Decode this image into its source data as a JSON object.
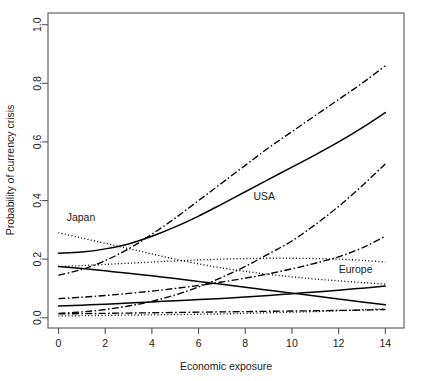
{
  "chart_data": {
    "type": "line",
    "title": "",
    "xlabel": "Economic exposure",
    "ylabel": "Probability of currency crisis",
    "xlim": [
      -0.45,
      14.8
    ],
    "ylim": [
      -0.035,
      1.04
    ],
    "xticks": [
      0,
      2,
      4,
      6,
      8,
      10,
      12,
      14
    ],
    "xticklabels": [
      "0",
      "2",
      "4",
      "6",
      "8",
      "10",
      "12",
      "14"
    ],
    "yticks": [
      0.0,
      0.2,
      0.4,
      0.6,
      0.8,
      1.0
    ],
    "yticklabels": [
      "0.0",
      "0.2",
      "0.4",
      "0.6",
      "0.8",
      "1.0"
    ],
    "grid": false,
    "legend": "none",
    "box": true,
    "annotations": [
      {
        "text": "Japan",
        "x": 0.35,
        "y": 0.345
      },
      {
        "text": "USA",
        "x": 8.35,
        "y": 0.415
      },
      {
        "text": "Europe",
        "x": 12.0,
        "y": 0.165
      }
    ],
    "x": [
      0,
      1,
      2,
      3,
      4,
      5,
      6,
      7,
      8,
      9,
      10,
      11,
      12,
      13,
      14
    ],
    "series": [
      {
        "name": "rising-dashdot-high",
        "style": "dashdot",
        "values": [
          0.145,
          0.165,
          0.195,
          0.235,
          0.285,
          0.34,
          0.4,
          0.46,
          0.52,
          0.58,
          0.635,
          0.69,
          0.745,
          0.8,
          0.86
        ]
      },
      {
        "name": "usa-solid-rising",
        "style": "solid",
        "values": [
          0.22,
          0.224,
          0.235,
          0.252,
          0.278,
          0.31,
          0.347,
          0.388,
          0.43,
          0.472,
          0.514,
          0.556,
          0.6,
          0.648,
          0.7
        ]
      },
      {
        "name": "rising-dashdot-mid",
        "style": "dashdot",
        "values": [
          0.015,
          0.02,
          0.028,
          0.04,
          0.056,
          0.078,
          0.105,
          0.138,
          0.175,
          0.218,
          0.262,
          0.318,
          0.38,
          0.45,
          0.525
        ]
      },
      {
        "name": "japan-dotted-falling",
        "style": "dotted",
        "values": [
          0.29,
          0.272,
          0.254,
          0.236,
          0.218,
          0.2,
          0.184,
          0.17,
          0.158,
          0.148,
          0.14,
          0.132,
          0.126,
          0.12,
          0.115
        ]
      },
      {
        "name": "rising-dotted-low",
        "style": "dotted",
        "values": [
          0.175,
          0.178,
          0.182,
          0.186,
          0.19,
          0.194,
          0.197,
          0.2,
          0.202,
          0.203,
          0.203,
          0.202,
          0.2,
          0.196,
          0.19
        ]
      },
      {
        "name": "rising-dashdot-low",
        "style": "dashdot",
        "values": [
          0.065,
          0.07,
          0.076,
          0.083,
          0.091,
          0.1,
          0.11,
          0.122,
          0.135,
          0.15,
          0.167,
          0.186,
          0.208,
          0.238,
          0.278
        ]
      },
      {
        "name": "europe-solid-slow-rise",
        "style": "solid",
        "values": [
          0.04,
          0.043,
          0.046,
          0.05,
          0.054,
          0.058,
          0.062,
          0.066,
          0.071,
          0.076,
          0.082,
          0.088,
          0.094,
          0.101,
          0.108
        ]
      },
      {
        "name": "solid-falling-flat",
        "style": "solid",
        "values": [
          0.175,
          0.168,
          0.16,
          0.152,
          0.143,
          0.134,
          0.124,
          0.114,
          0.104,
          0.094,
          0.084,
          0.074,
          0.064,
          0.054,
          0.044
        ]
      },
      {
        "name": "flat-dashdot-baseline",
        "style": "dashdot",
        "values": [
          0.013,
          0.014,
          0.015,
          0.016,
          0.017,
          0.018,
          0.019,
          0.02,
          0.021,
          0.022,
          0.023,
          0.024,
          0.025,
          0.026,
          0.028
        ]
      },
      {
        "name": "flat-dotted-baseline",
        "style": "dotted",
        "values": [
          0.006,
          0.007,
          0.008,
          0.009,
          0.01,
          0.011,
          0.012,
          0.013,
          0.015,
          0.017,
          0.019,
          0.021,
          0.024,
          0.027,
          0.03
        ]
      }
    ],
    "colors": {
      "line": "#000000",
      "axis": "#555555",
      "background": "#ffffff"
    }
  }
}
